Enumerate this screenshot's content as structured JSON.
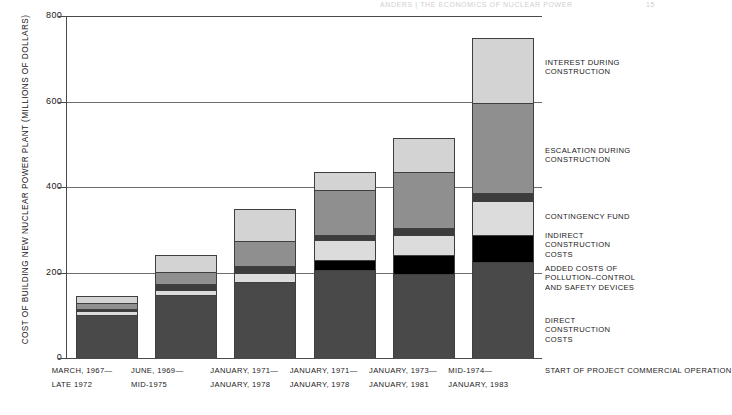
{
  "header": {
    "left": "ANDERS  |  THE ECONOMICS OF NUCLEAR POWER",
    "right": "15"
  },
  "chart_data": {
    "type": "bar",
    "stacked": true,
    "title": "",
    "xlabel": "",
    "ylabel": "COST OF BUILDING NEW NUCLEAR POWER PLANT (MILLIONS OF DOLLARS)",
    "ylim": [
      0,
      800
    ],
    "yticks": [
      0,
      200,
      400,
      600,
      800
    ],
    "ytick_labels": [
      "0",
      "200",
      "400",
      "600",
      "800"
    ],
    "grid": true,
    "legend_position": "right",
    "categories": [
      "MARCH, 1967-LATE 1972",
      "JUNE, 1969-MID-1975",
      "JANUARY, 1971-JANUARY, 1978",
      "JANUARY, 1971-JANUARY, 1978",
      "JANUARY, 1973-JANUARY, 1981",
      "MID-1974-JANUARY, 1983"
    ],
    "category_lines": [
      {
        "start": "MARCH, 1967—",
        "operation": "LATE 1972"
      },
      {
        "start": "JUNE, 1969—",
        "operation": "MID-1975"
      },
      {
        "start": "JANUARY, 1971—",
        "operation": "JANUARY, 1978"
      },
      {
        "start": "JANUARY, 1971—",
        "operation": "JANUARY, 1978"
      },
      {
        "start": "JANUARY, 1973—",
        "operation": "JANUARY, 1981"
      },
      {
        "start": "MID-1974—",
        "operation": "JANUARY, 1983"
      }
    ],
    "axis_row_labels": {
      "start": "START OF PROJECT",
      "operation": "COMMERCIAL OPERATION"
    },
    "series": [
      {
        "name": "DIRECT CONSTRUCTION COSTS",
        "key": "direct",
        "color": "#494949",
        "values": [
          100,
          148,
          178,
          205,
          196,
          225
        ]
      },
      {
        "name": "ADDED COSTS OF POLLUTION-CONTROL AND SAFETY DEVICES",
        "key": "added",
        "color": "#000000",
        "values": [
          0,
          0,
          0,
          24,
          44,
          62
        ]
      },
      {
        "name": "INDIRECT CONSTRUCTION COSTS",
        "key": "indirect",
        "color": "#dcdcdc",
        "values": [
          10,
          12,
          20,
          46,
          48,
          80
        ]
      },
      {
        "name": "CONTINGENCY FUND",
        "key": "contingency",
        "color": "#3c3c3c",
        "values": [
          5,
          13,
          18,
          13,
          17,
          20
        ]
      },
      {
        "name": "ESCALATION DURING CONSTRUCTION",
        "key": "escalation",
        "color": "#8f8f8f",
        "values": [
          13,
          29,
          57,
          104,
          130,
          210
        ]
      },
      {
        "name": "INTEREST DURING CONSTRUCTION",
        "key": "interest",
        "color": "#d3d3d3",
        "values": [
          17,
          40,
          75,
          43,
          80,
          151
        ]
      }
    ],
    "totals": [
      145,
      242,
      348,
      435,
      515,
      748
    ]
  },
  "legend": {
    "items": [
      {
        "label_line1": "INTEREST DURING",
        "label_line2": "CONSTRUCTION",
        "label_line3": ""
      },
      {
        "label_line1": "ESCALATION DURING",
        "label_line2": "CONSTRUCTION",
        "label_line3": ""
      },
      {
        "label_line1": "CONTINGENCY FUND",
        "label_line2": "",
        "label_line3": ""
      },
      {
        "label_line1": "INDIRECT",
        "label_line2": "CONSTRUCTION",
        "label_line3": "COSTS"
      },
      {
        "label_line1": "ADDED COSTS OF",
        "label_line2": "POLLUTION–CONTROL",
        "label_line3": "AND SAFETY DEVICES"
      },
      {
        "label_line1": "DIRECT",
        "label_line2": "CONSTRUCTION",
        "label_line3": "COSTS"
      }
    ]
  }
}
